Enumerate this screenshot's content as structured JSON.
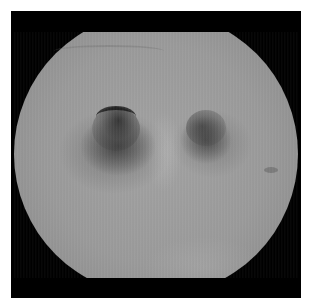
{
  "image": {
    "description": "Grayscale endoscopic view showing two dark airway openings (bifurcation) within a circular field of view on a black frame",
    "colors": {
      "frame": "#000000",
      "background": "#ffffff",
      "mucosa": "#9a9a9a",
      "openings": "#2a2a2a"
    },
    "features": [
      {
        "name": "left-opening",
        "shape": "ellipse"
      },
      {
        "name": "right-opening",
        "shape": "ellipse"
      },
      {
        "name": "carina-ridge",
        "shape": "vertical ridge"
      },
      {
        "name": "mucosal-fold",
        "shape": "arc"
      }
    ]
  }
}
